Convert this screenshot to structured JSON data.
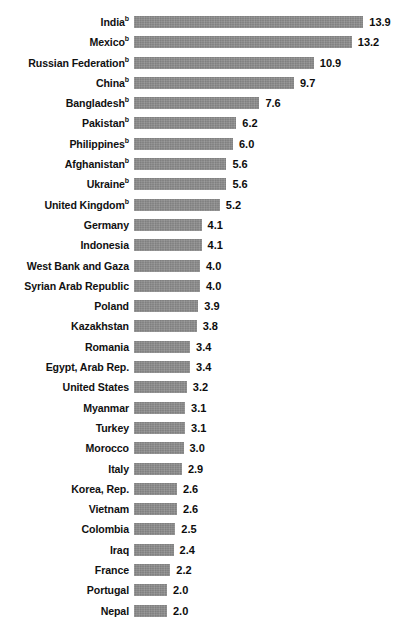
{
  "figure": {
    "title_fragment": "",
    "bar_color": "#8b8b8b",
    "label_color": "#111111",
    "value_color": "#0d0d0d",
    "background": "#ffffff",
    "footnote_marker": "b"
  },
  "chart_data": {
    "type": "bar",
    "orientation": "horizontal",
    "title": "",
    "subtitle": "",
    "xlabel": "",
    "ylabel": "",
    "grid": false,
    "legend": false,
    "xlim": [
      0,
      13.9
    ],
    "value_format": "one-decimal",
    "categories": [
      "India",
      "Mexico",
      "Russian Federation",
      "China",
      "Bangladesh",
      "Pakistan",
      "Philippines",
      "Afghanistan",
      "Ukraine",
      "United Kingdom",
      "Germany",
      "Indonesia",
      "West Bank and Gaza",
      "Syrian Arab Republic",
      "Poland",
      "Kazakhstan",
      "Romania",
      "Egypt, Arab Rep.",
      "United States",
      "Myanmar",
      "Turkey",
      "Morocco",
      "Italy",
      "Korea, Rep.",
      "Vietnam",
      "Colombia",
      "Iraq",
      "France",
      "Portugal",
      "Nepal"
    ],
    "values": [
      13.9,
      13.2,
      10.9,
      9.7,
      7.6,
      6.2,
      6.0,
      5.6,
      5.6,
      5.2,
      4.1,
      4.1,
      4.0,
      4.0,
      3.9,
      3.8,
      3.4,
      3.4,
      3.2,
      3.1,
      3.1,
      3.0,
      2.9,
      2.6,
      2.6,
      2.5,
      2.4,
      2.2,
      2.0,
      2.0
    ],
    "value_labels": [
      "13.9",
      "13.2",
      "10.9",
      "9.7",
      "7.6",
      "6.2",
      "6.0",
      "5.6",
      "5.6",
      "5.2",
      "4.1",
      "4.1",
      "4.0",
      "4.0",
      "3.9",
      "3.8",
      "3.4",
      "3.4",
      "3.2",
      "3.1",
      "3.1",
      "3.0",
      "2.9",
      "2.6",
      "2.6",
      "2.5",
      "2.4",
      "2.2",
      "2.0",
      "2.0"
    ],
    "footnoted_categories": [
      "India",
      "Mexico",
      "Russian Federation",
      "China",
      "Bangladesh",
      "Pakistan",
      "Philippines",
      "Afghanistan",
      "Ukraine",
      "United Kingdom"
    ]
  }
}
